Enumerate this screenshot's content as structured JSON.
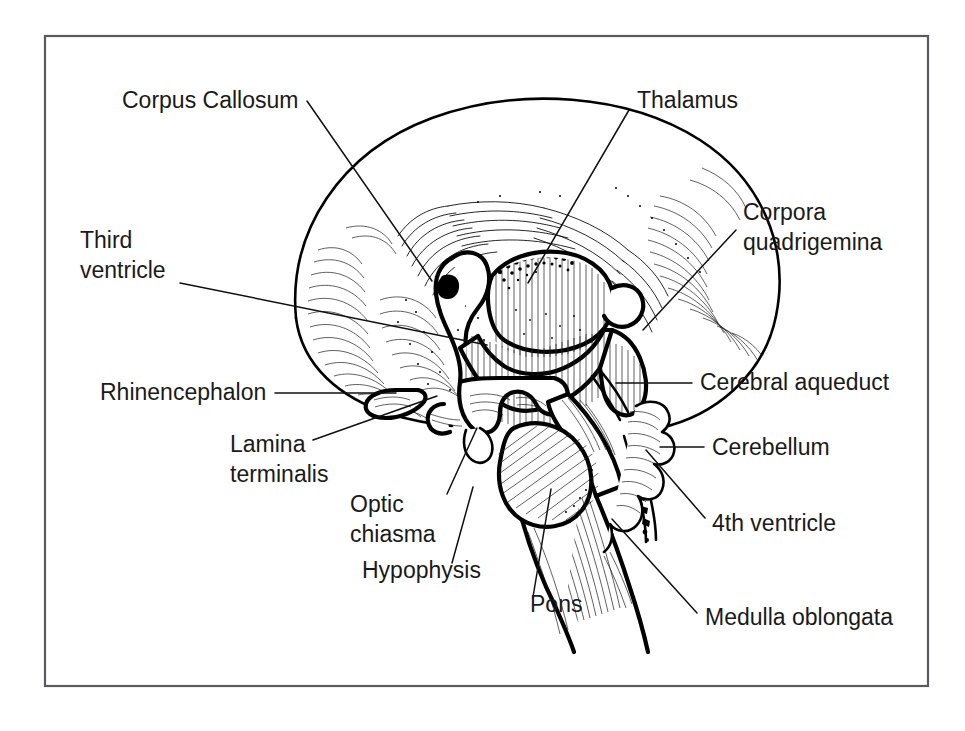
{
  "figure": {
    "type": "anatomical-line-drawing",
    "style": "black-and-white pen-and-ink hatched illustration",
    "background_color": "#ffffff",
    "ink_color": "#000000",
    "frame": {
      "present": true,
      "border_color": "#5a5a5e",
      "border_width_px": 2,
      "x": 45,
      "y": 36,
      "width": 883,
      "height": 650
    }
  },
  "labels": [
    {
      "id": "corpus-callosum",
      "text": "Corpus Callosum",
      "lines": [
        "Corpus Callosum"
      ],
      "text_x": 122,
      "text_y": 108,
      "anchor": "start",
      "leader": {
        "x1": 307,
        "y1": 101,
        "x2": 432,
        "y2": 281
      },
      "side": "upper-left"
    },
    {
      "id": "thalamus",
      "text": "Thalamus",
      "lines": [
        "Thalamus"
      ],
      "text_x": 637,
      "text_y": 108,
      "anchor": "start",
      "leader": {
        "x1": 629,
        "y1": 110,
        "x2": 528,
        "y2": 283
      },
      "side": "upper-right"
    },
    {
      "id": "corpora-quadrigemina",
      "text": "Corpora quadrigemina",
      "lines": [
        "Corpora",
        "quadrigemina"
      ],
      "text_x": 743,
      "text_y": 220,
      "anchor": "start",
      "leader": {
        "x1": 736,
        "y1": 230,
        "x2": 643,
        "y2": 330
      },
      "side": "right"
    },
    {
      "id": "third-ventricle",
      "text": "Third ventricle",
      "lines": [
        "Third",
        "ventricle"
      ],
      "text_x": 80,
      "text_y": 248,
      "anchor": "start",
      "leader": {
        "x1": 180,
        "y1": 283,
        "x2": 487,
        "y2": 345
      },
      "side": "left"
    },
    {
      "id": "rhinencephalon",
      "text": "Rhinencephalon",
      "lines": [
        "Rhinencephalon"
      ],
      "text_x": 100,
      "text_y": 400,
      "anchor": "start",
      "leader": {
        "x1": 275,
        "y1": 393,
        "x2": 396,
        "y2": 393
      },
      "side": "left"
    },
    {
      "id": "lamina-terminalis",
      "text": "Lamina terminalis",
      "lines": [
        "Lamina",
        "terminalis"
      ],
      "text_x": 230,
      "text_y": 452,
      "anchor": "start",
      "leader": {
        "x1": 313,
        "y1": 440,
        "x2": 437,
        "y2": 396
      },
      "side": "left"
    },
    {
      "id": "optic-chiasma",
      "text": "Optic chiasma",
      "lines": [
        "Optic",
        "chiasma"
      ],
      "text_x": 350,
      "text_y": 512,
      "anchor": "start",
      "leader": {
        "x1": 447,
        "y1": 494,
        "x2": 477,
        "y2": 428
      },
      "side": "bottom-left"
    },
    {
      "id": "hypophysis",
      "text": "Hypophysis",
      "lines": [
        "Hypophysis"
      ],
      "text_x": 362,
      "text_y": 578,
      "anchor": "start",
      "leader": {
        "x1": 452,
        "y1": 563,
        "x2": 473,
        "y2": 487
      },
      "side": "bottom"
    },
    {
      "id": "pons",
      "text": "Pons",
      "lines": [
        "Pons"
      ],
      "text_x": 530,
      "text_y": 612,
      "anchor": "start",
      "leader": {
        "x1": 533,
        "y1": 597,
        "x2": 551,
        "y2": 489
      },
      "side": "bottom"
    },
    {
      "id": "medulla-oblongata",
      "text": "Medulla oblongata",
      "lines": [
        "Medulla oblongata"
      ],
      "text_x": 705,
      "text_y": 625,
      "anchor": "start",
      "leader": {
        "x1": 697,
        "y1": 613,
        "x2": 612,
        "y2": 519
      },
      "side": "bottom-right"
    },
    {
      "id": "cerebral-aqueduct",
      "text": "Cerebral aqueduct",
      "lines": [
        "Cerebral aqueduct"
      ],
      "text_x": 700,
      "text_y": 390,
      "anchor": "start",
      "leader": {
        "x1": 692,
        "y1": 383,
        "x2": 663,
        "y2": 383
      },
      "side": "right"
    },
    {
      "id": "cerebellum",
      "text": "Cerebellum",
      "lines": [
        "Cerebellum"
      ],
      "text_x": 712,
      "text_y": 455,
      "anchor": "start",
      "leader": {
        "x1": 704,
        "y1": 447,
        "x2": 672,
        "y2": 447
      },
      "side": "right"
    },
    {
      "id": "fourth-ventricle",
      "text": "4th ventricle",
      "lines": [
        "4th ventricle"
      ],
      "text_x": 712,
      "text_y": 531,
      "anchor": "start",
      "leader": {
        "x1": 705,
        "y1": 518,
        "x2": 646,
        "y2": 450
      },
      "side": "right"
    }
  ],
  "structures": [
    {
      "id": "cerebrum",
      "name": "Cerebrum (cerebral hemisphere outline)"
    },
    {
      "id": "corpus-callosum-body",
      "name": "Corpus callosum"
    },
    {
      "id": "thalamus-body",
      "name": "Thalamus"
    },
    {
      "id": "third-ventricle-cavity",
      "name": "Third ventricle"
    },
    {
      "id": "corpora-quadrigemina-body",
      "name": "Corpora quadrigemina"
    },
    {
      "id": "cerebellum-body",
      "name": "Cerebellum"
    },
    {
      "id": "pons-body",
      "name": "Pons"
    },
    {
      "id": "medulla-body",
      "name": "Medulla oblongata"
    },
    {
      "id": "optic-chiasma-body",
      "name": "Optic chiasma"
    },
    {
      "id": "hypophysis-body",
      "name": "Hypophysis"
    },
    {
      "id": "fourth-ventricle-cavity",
      "name": "Fourth ventricle"
    },
    {
      "id": "cerebral-aqueduct-channel",
      "name": "Cerebral aqueduct"
    },
    {
      "id": "lamina-terminalis-band",
      "name": "Lamina terminalis"
    },
    {
      "id": "rhinencephalon-lobe",
      "name": "Rhinencephalon"
    }
  ]
}
